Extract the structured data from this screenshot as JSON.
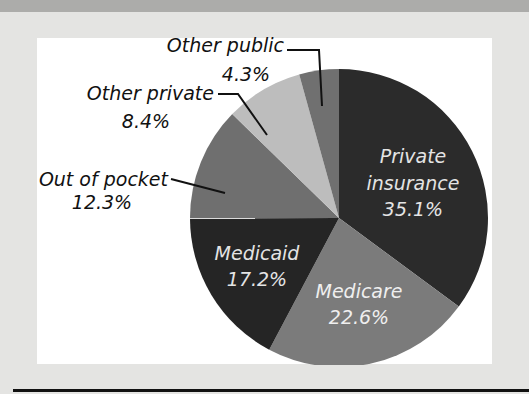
{
  "chart_data": {
    "type": "pie",
    "title": "",
    "start_angle": "12 o'clock, clockwise",
    "slices": [
      {
        "label": "Private insurance",
        "value": 35.1,
        "display": "35.1%",
        "color": "#2b2b2b",
        "label_inside": true
      },
      {
        "label": "Medicare",
        "value": 22.6,
        "display": "22.6%",
        "color": "#7b7b7b",
        "label_inside": true
      },
      {
        "label": "Medicaid",
        "value": 17.2,
        "display": "17.2%",
        "color": "#252525",
        "label_inside": true
      },
      {
        "label": "Out of pocket",
        "value": 12.3,
        "display": "12.3%",
        "color": "#6f6f6f",
        "label_inside": false
      },
      {
        "label": "Other private",
        "value": 8.4,
        "display": "8.4%",
        "color": "#bdbdbd",
        "label_inside": false
      },
      {
        "label": "Other public",
        "value": 4.3,
        "display": "4.3%",
        "color": "#707070",
        "label_inside": false
      }
    ]
  },
  "labels": {
    "private_line1": "Private",
    "private_line2": "insurance",
    "private_pct": "35.1%",
    "medicare_name": "Medicare",
    "medicare_pct": "22.6%",
    "medicaid_name": "Medicaid",
    "medicaid_pct": "17.2%",
    "oop_name": "Out of pocket",
    "oop_pct": "12.3%",
    "other_private_name": "Other private",
    "other_private_pct": "8.4%",
    "other_public_name": "Other public",
    "other_public_pct": "4.3%"
  }
}
